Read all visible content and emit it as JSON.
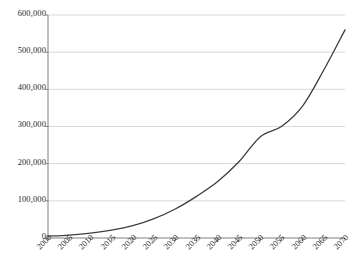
{
  "chart_data": {
    "type": "line",
    "title": "",
    "subtitle": "",
    "xlabel": "",
    "ylabel": "",
    "grid": "horizontal",
    "legend": "none",
    "xlim": [
      2000,
      2070
    ],
    "ylim": [
      0,
      600000
    ],
    "x_tick_labels": [
      "2000",
      "2005",
      "2010",
      "2015",
      "2020",
      "2025",
      "2030",
      "2035",
      "2040",
      "2045",
      "2050",
      "2055",
      "2060",
      "2065",
      "2070"
    ],
    "y_tick_labels": [
      "0",
      "100,000",
      "200,000",
      "300,000",
      "400,000",
      "500,000",
      "600,000"
    ],
    "y_tick_values": [
      0,
      100000,
      200000,
      300000,
      400000,
      500000,
      600000
    ],
    "series": [
      {
        "name": "series-1",
        "color": "#3d3d4a",
        "x": [
          2000,
          2005,
          2010,
          2015,
          2020,
          2025,
          2030,
          2035,
          2040,
          2045,
          2050,
          2055,
          2060,
          2065,
          2070
        ],
        "values": [
          5000,
          8000,
          13000,
          21000,
          33000,
          52000,
          78000,
          112000,
          152000,
          205000,
          272000,
          300000,
          355000,
          452000,
          560000
        ]
      }
    ],
    "annotations": []
  },
  "axis": {
    "line_color": "#808080",
    "grid_color": "#d9d9d9",
    "tick_color": "#808080",
    "label_color": "#2b2b2b"
  }
}
